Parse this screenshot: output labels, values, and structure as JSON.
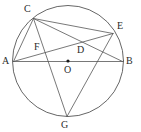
{
  "figure": {
    "stroke_color": "#555555",
    "label_color": "#2b2b2b",
    "background_color": "#ffffff"
  },
  "circle": {
    "name": "circumcircle",
    "cx": 68,
    "cy": 61,
    "r": 55.5
  },
  "points": {
    "A": {
      "label": "A",
      "x": 13.5,
      "y": 61.5,
      "label_x": 2,
      "label_y": 56,
      "on_circle": true,
      "marked": false
    },
    "B": {
      "label": "B",
      "x": 122.5,
      "y": 61.5,
      "label_x": 126,
      "label_y": 56,
      "on_circle": true,
      "marked": false
    },
    "C": {
      "label": "C",
      "x": 33.5,
      "y": 18.5,
      "label_x": 24,
      "label_y": 4,
      "on_circle": true,
      "marked": false
    },
    "E": {
      "label": "E",
      "x": 113.0,
      "y": 33.5,
      "label_x": 117,
      "label_y": 21,
      "on_circle": true,
      "marked": false
    },
    "G": {
      "label": "G",
      "x": 67.0,
      "y": 116.5,
      "label_x": 61,
      "label_y": 120,
      "on_circle": true,
      "marked": false
    },
    "D": {
      "label": "D",
      "x": 78.0,
      "y": 52.0,
      "label_x": 77,
      "label_y": 45,
      "on_circle": false,
      "marked": false
    },
    "F": {
      "label": "F",
      "x": 41.0,
      "y": 50.0,
      "label_x": 34,
      "label_y": 42,
      "on_circle": false,
      "marked": false
    },
    "O": {
      "label": "O",
      "x": 68.0,
      "y": 61.0,
      "label_x": 64,
      "label_y": 65,
      "on_circle": false,
      "marked": true
    }
  },
  "segments": [
    {
      "name": "segment-AB",
      "from": "A",
      "to": "B"
    },
    {
      "name": "segment-AC",
      "from": "A",
      "to": "C"
    },
    {
      "name": "segment-AE",
      "from": "A",
      "to": "E"
    },
    {
      "name": "segment-CB",
      "from": "C",
      "to": "B"
    },
    {
      "name": "segment-CE",
      "from": "C",
      "to": "E"
    },
    {
      "name": "segment-CG",
      "from": "C",
      "to": "G"
    },
    {
      "name": "segment-EG",
      "from": "E",
      "to": "G"
    }
  ],
  "center_dot": {
    "name": "center-dot",
    "cx": 68,
    "cy": 61,
    "r": 1.6
  }
}
